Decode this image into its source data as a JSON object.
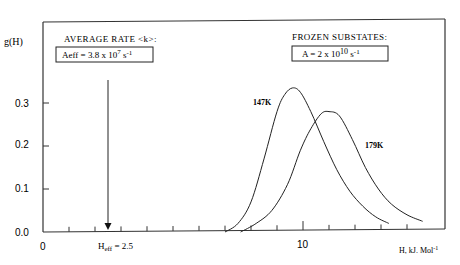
{
  "chart_data": {
    "type": "line",
    "title": "",
    "xlabel": "H, kJ. Mol-1",
    "ylabel": "g(H)",
    "xlim": [
      0,
      15.5
    ],
    "ylim": [
      0,
      0.43
    ],
    "x_ticks": [
      1,
      2,
      3,
      4,
      5,
      6,
      7,
      8,
      9,
      10,
      11,
      12,
      13,
      14
    ],
    "x_tick_labels": [
      {
        "value": 0,
        "label": "0"
      },
      {
        "value": 10,
        "label": "10"
      }
    ],
    "y_ticks": [
      0.0,
      0.1,
      0.2,
      0.3
    ],
    "y_tick_labels": [
      "0.0",
      "0.1",
      "0.2",
      "0.3"
    ],
    "grid": false,
    "series": [
      {
        "name": "147K",
        "x": [
          7.0,
          7.5,
          8.0,
          8.5,
          9.0,
          9.3,
          9.6,
          9.9,
          10.3,
          10.8,
          11.3,
          11.8,
          12.3,
          12.8,
          13.3
        ],
        "values": [
          0.0,
          0.02,
          0.07,
          0.17,
          0.28,
          0.32,
          0.335,
          0.325,
          0.28,
          0.21,
          0.145,
          0.095,
          0.06,
          0.035,
          0.02
        ]
      },
      {
        "name": "179K",
        "x": [
          7.6,
          8.2,
          8.8,
          9.4,
          9.9,
          10.3,
          10.7,
          11.0,
          11.4,
          11.9,
          12.4,
          12.9,
          13.4,
          14.0,
          14.6
        ],
        "values": [
          0.0,
          0.02,
          0.05,
          0.11,
          0.19,
          0.24,
          0.275,
          0.28,
          0.27,
          0.215,
          0.15,
          0.1,
          0.065,
          0.04,
          0.025
        ]
      }
    ],
    "annotations": [
      {
        "text": "AVERAGE RATE <k>:",
        "kind": "heading"
      },
      {
        "text": "Aeff = 3.8 x 10^7 s-1",
        "kind": "boxed"
      },
      {
        "text": "FROZEN SUBSTATES:",
        "kind": "heading"
      },
      {
        "text": "A = 2 x 10^10 s-1",
        "kind": "boxed"
      },
      {
        "text": "Heff = 2.5",
        "kind": "arrow-label",
        "x": 2.5
      },
      {
        "text": "147K",
        "kind": "curve-label"
      },
      {
        "text": "179K",
        "kind": "curve-label"
      }
    ]
  },
  "labels": {
    "ylabel": "g(H)",
    "xlabel_main": "H, kJ. Mol",
    "xlabel_sup": "-1",
    "avg_heading": "AVERAGE RATE <k>:",
    "aeff_main": "Aeff = 3.8 x 10",
    "aeff_exp": "7",
    "aeff_unit": " s",
    "aeff_unit_sup": "-1",
    "frozen_heading": "FROZEN SUBSTATES:",
    "a_main": "A = 2 x 10",
    "a_exp": "10",
    "a_unit": " s",
    "a_unit_sup": "-1",
    "heff_main": "H",
    "heff_sub": "eff",
    "heff_val": " = 2.5",
    "series1": "147K",
    "series2": "179K",
    "x0": "0",
    "x10": "10",
    "y0": "0.0",
    "y1": "0.1",
    "y2": "0.2",
    "y3": "0.3"
  }
}
